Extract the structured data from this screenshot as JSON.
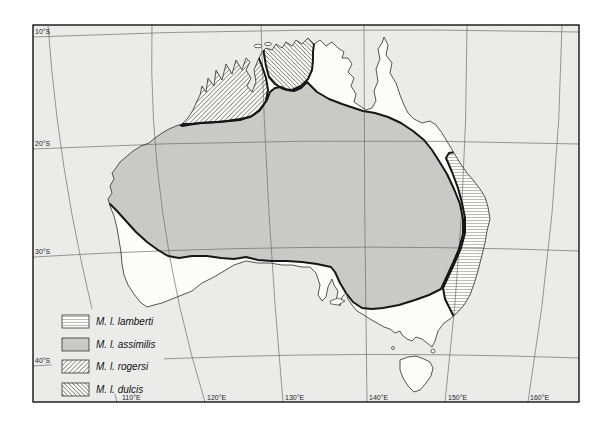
{
  "figure": {
    "kind": "species-distribution-map",
    "area": "Australia"
  },
  "axes": {
    "lat": [
      "10°S",
      "20°S",
      "30°S",
      "40°S"
    ],
    "lon": [
      "110°E",
      "120°E",
      "130°E",
      "140°E",
      "150°E",
      "160°E"
    ]
  },
  "legend": {
    "items": [
      {
        "label": "M. l. lamberti",
        "pattern": "horizontal-lines"
      },
      {
        "label": "M. l. assimilis",
        "pattern": "solid-gray"
      },
      {
        "label": "M. l. rogersi",
        "pattern": "diagonal-hatch-up"
      },
      {
        "label": "M. l. dulcis",
        "pattern": "diagonal-hatch-down"
      }
    ]
  },
  "colors": {
    "ocean": "#ebecea",
    "land": "#fcfcfa",
    "assimilis": "#c9c9c6",
    "boundary": "#161616",
    "coastline": "#2b2b2b",
    "graticule": "#6e6e6e",
    "frame": "#000000"
  }
}
